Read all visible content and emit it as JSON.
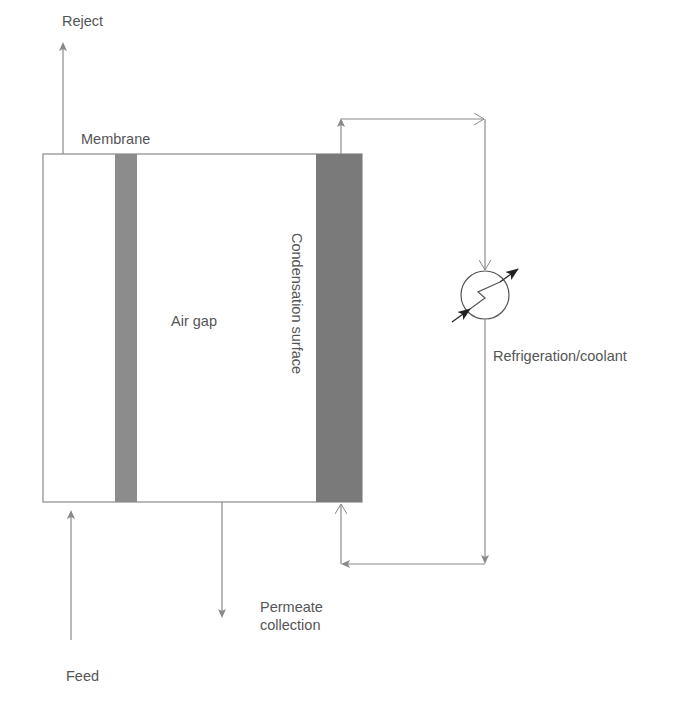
{
  "diagram": {
    "type": "air-gap-membrane-distillation",
    "labels": {
      "reject": "Reject",
      "membrane": "Membrane",
      "air_gap": "Air gap",
      "condensation_surface": "Condensation surface",
      "refrigeration": "Refrigeration/coolant",
      "permeate_line1": "Permeate",
      "permeate_line2": "collection",
      "feed": "Feed"
    },
    "colors": {
      "line": "#8a8a8a",
      "membrane_fill": "#8c8c8c",
      "condensation_fill": "#7a7a7a",
      "text": "#555555",
      "heat_exchanger_arrow": "#222222"
    }
  }
}
